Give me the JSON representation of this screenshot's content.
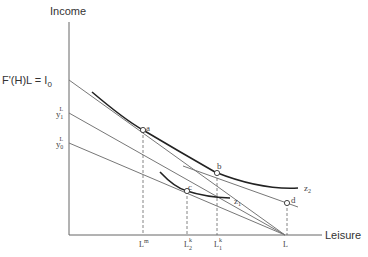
{
  "axes": {
    "y_label": "Income",
    "x_label": "Leisure"
  },
  "y_intercepts": {
    "top": "F'(H)L = I",
    "top_sub": "0",
    "y1": {
      "base": "y",
      "sub": "1",
      "sup": "L"
    },
    "y0": {
      "base": "y",
      "sub": "0",
      "sup": "L"
    }
  },
  "x_ticks": [
    {
      "base": "L",
      "sup": "m",
      "sub": ""
    },
    {
      "base": "L",
      "sup": "k",
      "sub": "2"
    },
    {
      "base": "L",
      "sup": "k",
      "sub": "1"
    },
    {
      "base": "L",
      "sup": "",
      "sub": ""
    }
  ],
  "points": [
    "a",
    "b",
    "c",
    "d"
  ],
  "curves": {
    "z1": {
      "base": "z",
      "sub": "1"
    },
    "z2": {
      "base": "z",
      "sub": "2"
    }
  },
  "colors": {
    "line": "#555555",
    "curve": "#222222",
    "text": "#333333"
  }
}
